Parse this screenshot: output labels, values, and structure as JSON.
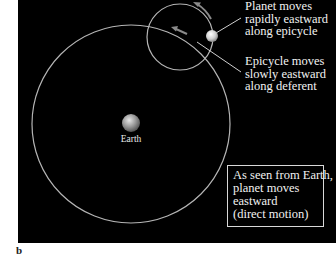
{
  "figure": {
    "panel_letter": "b",
    "background_color": "#000000",
    "line_color": "#bdbdbd"
  },
  "diagram": {
    "earth": {
      "label": "Earth",
      "center": [
        131,
        123
      ],
      "radius": 9
    },
    "deferent": {
      "center": [
        131,
        124
      ],
      "radius": 99
    },
    "epicycle": {
      "center": [
        180,
        37
      ],
      "radius": 33
    },
    "planet": {
      "center": [
        212,
        36
      ],
      "radius": 6
    },
    "labels": {
      "planet": [
        "Planet moves",
        "rapidly eastward",
        "along epicycle"
      ],
      "epicycle": [
        "Epicycle moves",
        "slowly eastward",
        "along deferent"
      ]
    },
    "info_box": {
      "lines": [
        "As seen from Earth,",
        "planet moves",
        "eastward",
        "(direct motion)"
      ]
    }
  }
}
